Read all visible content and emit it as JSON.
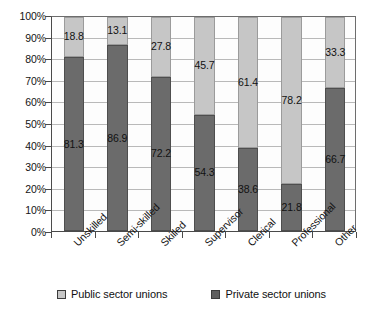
{
  "chart_data": {
    "type": "bar",
    "subtype": "stacked-percentage-column",
    "title": "",
    "subtitle": "",
    "xlabel": "",
    "ylabel": "",
    "ylim": [
      0,
      100
    ],
    "ytick_labels": [
      "100%",
      "90%",
      "80%",
      "70%",
      "60%",
      "50%",
      "40%",
      "30%",
      "20%",
      "10%",
      "0%"
    ],
    "ytick_values": [
      100,
      90,
      80,
      70,
      60,
      50,
      40,
      30,
      20,
      10,
      0
    ],
    "grid": true,
    "grid_axis": "y",
    "legend_position": "bottom",
    "categories": [
      "Unskilled",
      "Semi-skilled",
      "Skilled",
      "Supervisor",
      "Clerical",
      "Professional",
      "Other"
    ],
    "series": [
      {
        "name": "Private sector unions",
        "color": "#6b6b6b",
        "stack_order": "bottom",
        "values": [
          81.3,
          86.9,
          72.2,
          54.3,
          38.6,
          21.8,
          66.7
        ],
        "labels": [
          "81.3",
          "86.9",
          "72.2",
          "54.3",
          "38.6",
          "21.8",
          "66.7"
        ]
      },
      {
        "name": "Public sector unions",
        "color": "#c6c6c6",
        "stack_order": "top",
        "values": [
          18.8,
          13.1,
          27.8,
          45.7,
          61.4,
          78.2,
          33.3
        ],
        "labels": [
          "18.8",
          "13.1",
          "27.8",
          "45.7",
          "61.4",
          "78.2",
          "33.3"
        ]
      }
    ]
  },
  "legend": {
    "entries": [
      {
        "label": "Public sector unions",
        "swatch": "light-gray-square-icon"
      },
      {
        "label": "Private sector unions",
        "swatch": "dark-gray-square-icon"
      }
    ]
  }
}
